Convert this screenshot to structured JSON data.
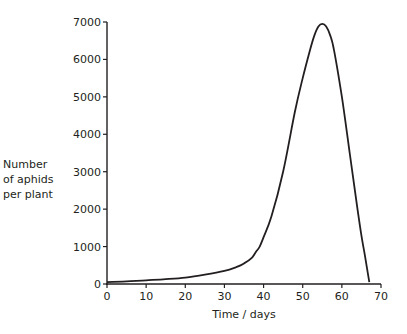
{
  "chart_data": {
    "type": "line",
    "title": "",
    "xlabel": "Time / days",
    "ylabel_lines": [
      "Number",
      "of aphids",
      "per plant"
    ],
    "ylabel": "Number of aphids per plant",
    "xlim": [
      0,
      70
    ],
    "ylim": [
      0,
      7000
    ],
    "x_ticks": [
      0,
      10,
      20,
      30,
      40,
      50,
      60,
      70
    ],
    "y_ticks": [
      0,
      1000,
      2000,
      3000,
      4000,
      5000,
      6000,
      7000
    ],
    "grid": false,
    "legend": null,
    "series": [
      {
        "name": "Aphids per plant",
        "x": [
          0,
          5,
          10,
          15,
          20,
          25,
          30,
          33,
          35,
          37,
          38,
          39,
          40,
          42,
          45,
          48,
          50,
          52,
          53,
          54,
          55,
          56,
          57,
          58,
          60,
          62,
          64,
          65,
          66,
          67
        ],
        "values": [
          50,
          70,
          100,
          130,
          170,
          250,
          350,
          450,
          550,
          700,
          850,
          1000,
          1250,
          1800,
          3000,
          4600,
          5500,
          6300,
          6650,
          6880,
          6950,
          6880,
          6650,
          6250,
          5000,
          3500,
          2000,
          1300,
          700,
          50
        ]
      }
    ]
  },
  "plot": {
    "line_color": "#231f20",
    "axis_color": "#231f20"
  }
}
